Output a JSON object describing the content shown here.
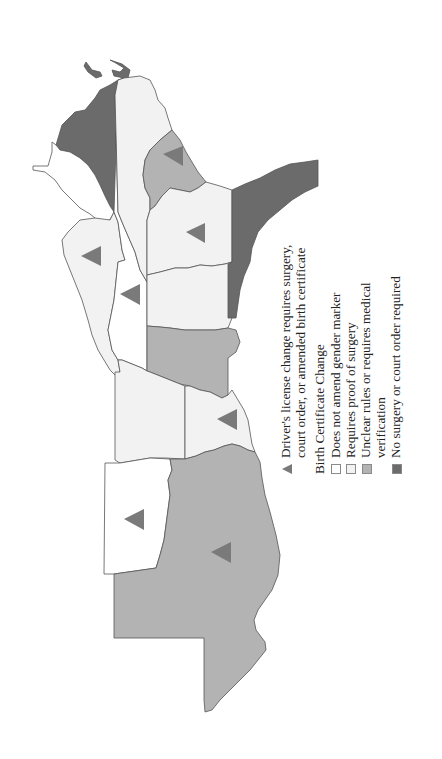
{
  "legend": {
    "triangle_label": "Driver's license change requires surgery, court order, or amended birth certificate",
    "triangle_color": "#7a7a7a",
    "heading": "Birth Certificate Change",
    "items": [
      {
        "label": "Does not amend gender marker",
        "color": "#ffffff"
      },
      {
        "label": "Requires proof of surgery",
        "color": "#f2f2f2"
      },
      {
        "label": "Unclear rules or requires medical verification",
        "color": "#b3b3b3"
      },
      {
        "label": "No surgery or court order required",
        "color": "#6b6b6b"
      }
    ]
  },
  "map": {
    "orientation": "rotated 90 degrees counter-clockwise (north points left)",
    "colors": {
      "does_not_amend": "#ffffff",
      "requires_surgery": "#f2f2f2",
      "unclear_medical": "#b3b3b3",
      "no_surgery": "#6b6b6b",
      "triangle": "#7a7a7a",
      "border": "#555555"
    },
    "regions": [
      {
        "id": "dark-north-left",
        "category": "no_surgery",
        "triangle": false
      },
      {
        "id": "white-far-left-upper",
        "category": "does_not_amend",
        "triangle": false
      },
      {
        "id": "light-left-mid",
        "category": "requires_surgery",
        "triangle": true
      },
      {
        "id": "white-column",
        "category": "does_not_amend",
        "triangle": true
      },
      {
        "id": "light-top-center",
        "category": "requires_surgery",
        "triangle": false
      },
      {
        "id": "gray-top-center",
        "category": "unclear_medical",
        "triangle": true
      },
      {
        "id": "light-center-right",
        "category": "requires_surgery",
        "triangle": true
      },
      {
        "id": "light-center",
        "category": "requires_surgery",
        "triangle": false
      },
      {
        "id": "gray-center",
        "category": "unclear_medical",
        "triangle": false
      },
      {
        "id": "dark-right-coast",
        "category": "no_surgery",
        "triangle": false
      },
      {
        "id": "light-lower-left",
        "category": "requires_surgery",
        "triangle": false
      },
      {
        "id": "light-lower-right",
        "category": "requires_surgery",
        "triangle": true
      },
      {
        "id": "white-bottom-left",
        "category": "does_not_amend",
        "triangle": true
      },
      {
        "id": "gray-large-bottom",
        "category": "unclear_medical",
        "triangle": true
      }
    ]
  }
}
